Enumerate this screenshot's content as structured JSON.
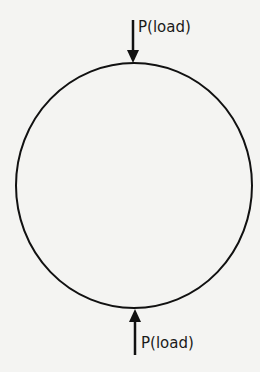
{
  "diagram": {
    "shape": "circle",
    "stroke_color": "#111111",
    "background": "#f4f4f2",
    "loads": [
      {
        "position": "top",
        "direction": "down",
        "label": "P(load)"
      },
      {
        "position": "bottom",
        "direction": "up",
        "label": "P(load)"
      }
    ]
  }
}
